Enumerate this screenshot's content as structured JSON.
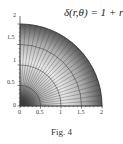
{
  "title": "δ(r,θ) = 1 + r",
  "caption": "Fig. 4",
  "chart_data": {
    "type": "heatmap",
    "title": "δ(r,θ) = 1 + r",
    "xlabel": "",
    "ylabel": "",
    "xlim": [
      0,
      2
    ],
    "ylim": [
      0,
      2
    ],
    "x_ticks": [
      "0",
      "0.5",
      "1",
      "1.5",
      "2"
    ],
    "y_ticks": [
      "0",
      "0.5",
      "1",
      "1.5",
      "2"
    ],
    "radial_arcs": [
      0.5,
      1,
      1.5,
      2
    ],
    "angular_lines_count": 24,
    "grid": true
  },
  "ticks": {
    "x": [
      "0",
      "0.5",
      "1",
      "1.5",
      "2"
    ],
    "y": [
      "0",
      "0.5",
      "1",
      "1.5",
      "2"
    ]
  }
}
